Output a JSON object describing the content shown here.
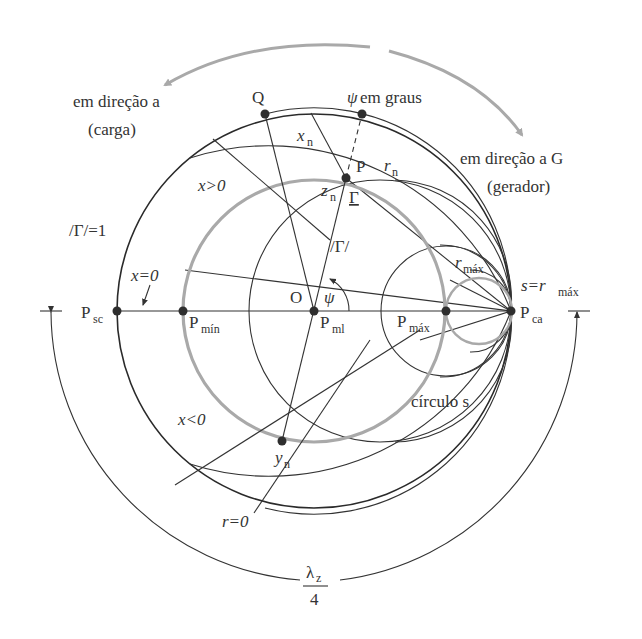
{
  "figure": {
    "type": "smith-chart-diagram",
    "colors": {
      "ink": "#333333",
      "s_circle": "#a9a9a9",
      "background": "#ffffff"
    }
  },
  "directions": {
    "toward_load_line1": "em direção a",
    "toward_load_line2": "(carga)",
    "toward_generator_line1": "em direção a G",
    "toward_generator_line2": "(gerador)"
  },
  "labels": {
    "Q": "Q",
    "psi_deg_sym": "ψ",
    "psi_deg_text": " em graus",
    "xn": "x",
    "xn_sub": "n",
    "P": "P",
    "rn": "r",
    "rn_sub": "n",
    "zn": "z",
    "zn_sub": "n",
    "gamma": "Γ",
    "x_pos": "x>0",
    "gamma_eq_1": "/Γ/=1",
    "gamma_mag": "/Γ/",
    "rmax": "r",
    "rmax_sub": "máx",
    "s_eq": "s=r",
    "s_eq_sub": "máx",
    "x_zero": "x=0",
    "O": "O",
    "psi": "ψ",
    "Psc": "P",
    "Psc_sub": "sc",
    "Pmin": "P",
    "Pmin_sub": "mín",
    "Pml": "P",
    "Pml_sub": "ml",
    "Pmax": "P",
    "Pmax_sub": "máx",
    "Pca": "P",
    "Pca_sub": "ca",
    "x_neg": "x<0",
    "circle_s": "círculo s",
    "yn": "y",
    "yn_sub": "n",
    "r_zero": "r=0",
    "lambda_num": "λ",
    "lambda_sub": "z",
    "lambda_den": "4"
  }
}
